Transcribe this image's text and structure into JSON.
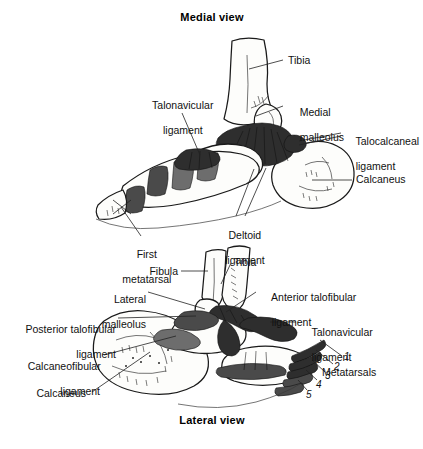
{
  "figure": {
    "kind": "anatomical-illustration",
    "titles": {
      "top": "Medial view",
      "bottom": "Lateral view"
    }
  },
  "medial_view": {
    "title": "Medial view",
    "labels": [
      {
        "id": "tibia",
        "text": "Tibia"
      },
      {
        "id": "medial-malleolus",
        "line1": "Medial",
        "line2": "malleolus"
      },
      {
        "id": "talonavicular",
        "line1": "Talonavicular",
        "line2": "ligament"
      },
      {
        "id": "talocalcaneal",
        "line1": "Talocalcaneal",
        "line2": "ligament"
      },
      {
        "id": "calcaneus",
        "text": "Calcaneus"
      },
      {
        "id": "deltoid",
        "line1": "Deltoid",
        "line2": "ligament"
      },
      {
        "id": "first-metatarsal",
        "line1": "First",
        "line2": "metatarsal"
      }
    ]
  },
  "lateral_view": {
    "title": "Lateral view",
    "labels": [
      {
        "id": "fibula",
        "text": "Fibula"
      },
      {
        "id": "tibia",
        "text": "Tibia"
      },
      {
        "id": "lateral-malleolus",
        "line1": "Lateral",
        "line2": "malleolus"
      },
      {
        "id": "anterior-talofibular",
        "line1": "Anterior talofibular",
        "line2": "ligament"
      },
      {
        "id": "talonavicular",
        "line1": "Talonavicular",
        "line2": "ligament"
      },
      {
        "id": "posterior-talofibular",
        "line1": "Posterior talofibular",
        "line2": "ligament"
      },
      {
        "id": "calcaneofibular",
        "line1": "Calcaneofibular",
        "line2": "ligament"
      },
      {
        "id": "calcaneus",
        "text": "Calcaneus"
      },
      {
        "id": "metatarsals",
        "text": "Metatarsals"
      }
    ],
    "metatarsal_numbers": [
      "1",
      "2",
      "3",
      "4",
      "5"
    ]
  },
  "colors": {
    "background": "#ffffff",
    "ink": "#111111",
    "bone_fill": "#fdfdfb",
    "ligament_dark": "#2e2e2e",
    "ligament_mid": "#4a4a4a",
    "ligament_light": "#6d6d6d"
  }
}
